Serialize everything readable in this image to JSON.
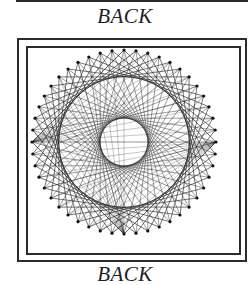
{
  "page": {
    "top_caption": "BACK",
    "bottom_caption": "BACK"
  },
  "illustration": {
    "type": "string-art circle",
    "peg_count": 48,
    "center": [
      124,
      142
    ],
    "radius": 92,
    "string_offsets": [
      12,
      20
    ],
    "line_color": "#1a1a1a",
    "peg_color": "#111111"
  }
}
